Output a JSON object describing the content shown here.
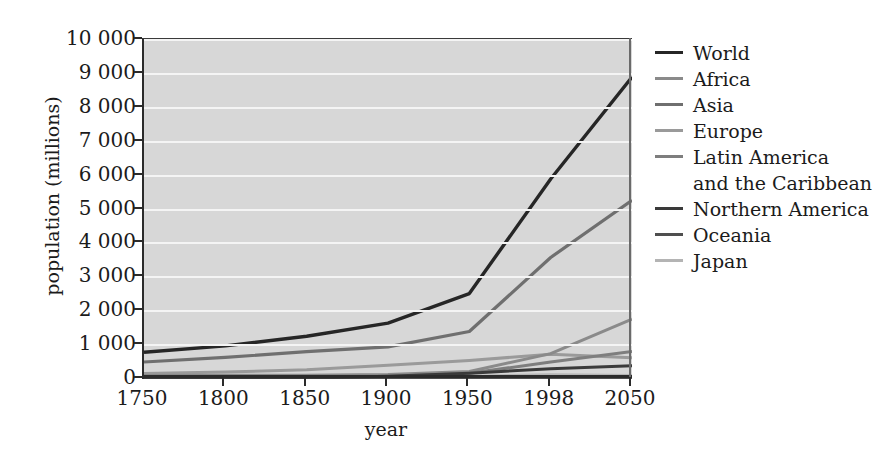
{
  "chart_data": {
    "type": "line",
    "title": "",
    "xlabel": "year",
    "ylabel": "population (millions)",
    "x": [
      "1750",
      "1800",
      "1850",
      "1900",
      "1950",
      "1998",
      "2050"
    ],
    "xtick_labels": [
      "1750",
      "1800",
      "1850",
      "1900",
      "1950",
      "1998",
      "2050"
    ],
    "ytick_labels": [
      "0",
      "1 000",
      "2 000",
      "3 000",
      "4 000",
      "5 000",
      "6 000",
      "7 000",
      "8 000",
      "9 000",
      "10 000"
    ],
    "ytick_values": [
      0,
      1000,
      2000,
      3000,
      4000,
      5000,
      6000,
      7000,
      8000,
      9000,
      10000
    ],
    "ylim": [
      0,
      10000
    ],
    "grid": "horizontal",
    "legend_position": "right",
    "series": [
      {
        "name": "World",
        "color": "#262626",
        "width": 3.4,
        "values": [
          791,
          978,
          1262,
          1650,
          2521,
          5901,
          8909
        ]
      },
      {
        "name": "Africa",
        "color": "#8a8a8a",
        "width": 3.0,
        "values": [
          106,
          107,
          111,
          133,
          221,
          749,
          1766
        ]
      },
      {
        "name": "Asia",
        "color": "#6f6f6f",
        "width": 3.2,
        "values": [
          502,
          635,
          809,
          947,
          1402,
          3585,
          5268
        ]
      },
      {
        "name": "Europe",
        "color": "#9a9a9a",
        "width": 3.0,
        "values": [
          163,
          203,
          276,
          408,
          547,
          729,
          628
        ]
      },
      {
        "name": "Latin America\nand the Caribbean",
        "color": "#7e7e7e",
        "width": 3.0,
        "values": [
          16,
          24,
          38,
          74,
          167,
          504,
          809
        ]
      },
      {
        "name": "Northern America",
        "color": "#3a3a3a",
        "width": 3.0,
        "values": [
          2,
          7,
          26,
          82,
          172,
          305,
          392
        ]
      },
      {
        "name": "Oceania",
        "color": "#4f4f4f",
        "width": 3.0,
        "values": [
          2,
          2,
          2,
          6,
          13,
          30,
          46
        ]
      },
      {
        "name": "Japan",
        "color": "#b4b4b4",
        "width": 3.0,
        "values": [
          30,
          30,
          32,
          45,
          84,
          126,
          105
        ]
      }
    ]
  },
  "legend": {
    "items": [
      {
        "label": "World"
      },
      {
        "label": "Africa"
      },
      {
        "label": "Asia"
      },
      {
        "label": "Europe"
      },
      {
        "label": "Latin America\nand the Caribbean"
      },
      {
        "label": "Northern America"
      },
      {
        "label": "Oceania"
      },
      {
        "label": "Japan"
      }
    ]
  },
  "axes": {
    "y_title": "population (millions)",
    "x_title": "year"
  },
  "colors": {
    "plot_background": "#d7d7d7",
    "gridline": "#f4f4f4",
    "axis": "#2b2b2b",
    "text": "#1b1b1b",
    "page_background": "#ffffff"
  }
}
